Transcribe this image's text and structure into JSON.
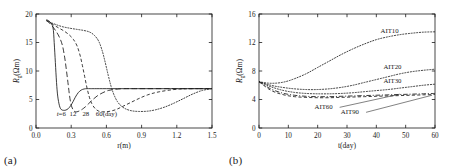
{
  "figure": {
    "panel_a_tag": "(a)",
    "panel_b_tag": "(b)"
  },
  "chart_data": [
    {
      "type": "line",
      "panel": "(a)",
      "title": "",
      "xlabel": "r(m)",
      "ylabel": "R_g(Ωm)",
      "ylabel_main": "R",
      "ylabel_sub": "g",
      "ylabel_unit": "(Ωm)",
      "xlim": [
        0.0,
        1.5
      ],
      "ylim": [
        0,
        20
      ],
      "xticks": [
        "0.0",
        "0.3",
        "0.6",
        "0.9",
        "1.2",
        "1.5"
      ],
      "xtick_values": [
        0.0,
        0.3,
        0.6,
        0.9,
        1.2,
        1.5
      ],
      "yticks": [
        "0",
        "5",
        "10",
        "15",
        "20"
      ],
      "ytick_values": [
        0,
        5,
        10,
        15,
        20
      ],
      "grid": false,
      "legend_position": "inline-annotations",
      "annotations": [
        {
          "text": "t=6",
          "x": 0.215,
          "y": 2.15
        },
        {
          "text": "12",
          "x": 0.315,
          "y": 2.15
        },
        {
          "text": "28",
          "x": 0.425,
          "y": 2.15
        },
        {
          "text": "60(day)",
          "x": 0.6,
          "y": 2.15
        }
      ],
      "series": [
        {
          "name": "t=6",
          "style": "solid",
          "x": [
            0.09,
            0.12,
            0.145,
            0.155,
            0.165,
            0.175,
            0.185,
            0.2,
            0.215,
            0.235,
            0.255,
            0.275,
            0.295,
            0.315,
            0.335,
            0.36,
            0.385,
            0.41,
            0.435,
            0.46,
            0.5,
            0.6,
            0.8,
            1.0,
            1.2,
            1.5
          ],
          "y": [
            19.0,
            18.6,
            17.6,
            15.0,
            11.5,
            8.0,
            5.6,
            3.9,
            3.25,
            3.1,
            3.15,
            3.4,
            3.9,
            4.6,
            5.4,
            6.2,
            6.65,
            6.85,
            6.9,
            6.9,
            6.9,
            6.9,
            6.9,
            6.9,
            6.9,
            6.9
          ]
        },
        {
          "name": "12",
          "style": "longdash",
          "x": [
            0.09,
            0.13,
            0.17,
            0.2,
            0.225,
            0.245,
            0.26,
            0.275,
            0.285,
            0.295,
            0.305,
            0.32,
            0.335,
            0.35,
            0.37,
            0.395,
            0.42,
            0.45,
            0.48,
            0.52,
            0.57,
            0.62,
            0.68,
            0.75,
            0.85,
            1.0,
            1.2,
            1.5
          ],
          "y": [
            18.9,
            18.1,
            17.0,
            15.9,
            14.5,
            12.3,
            10.0,
            7.5,
            5.8,
            4.5,
            3.7,
            3.05,
            2.85,
            2.85,
            3.0,
            3.3,
            3.7,
            4.3,
            4.9,
            5.6,
            6.2,
            6.6,
            6.8,
            6.9,
            6.9,
            6.9,
            6.9,
            6.9
          ]
        },
        {
          "name": "28",
          "style": "dash",
          "x": [
            0.09,
            0.14,
            0.19,
            0.24,
            0.285,
            0.32,
            0.35,
            0.375,
            0.395,
            0.415,
            0.435,
            0.455,
            0.475,
            0.5,
            0.53,
            0.565,
            0.6,
            0.645,
            0.69,
            0.74,
            0.8,
            0.87,
            0.95,
            1.05,
            1.2,
            1.35,
            1.5
          ],
          "y": [
            18.85,
            18.2,
            17.6,
            17.0,
            16.3,
            15.5,
            14.4,
            12.8,
            11.0,
            9.0,
            7.0,
            5.4,
            4.3,
            3.5,
            3.0,
            2.85,
            2.85,
            3.0,
            3.3,
            3.8,
            4.4,
            5.1,
            5.8,
            6.35,
            6.8,
            6.9,
            6.9
          ]
        },
        {
          "name": "60(day)",
          "style": "dot",
          "x": [
            0.09,
            0.15,
            0.22,
            0.29,
            0.35,
            0.41,
            0.46,
            0.5,
            0.535,
            0.565,
            0.59,
            0.615,
            0.64,
            0.665,
            0.695,
            0.73,
            0.77,
            0.82,
            0.88,
            0.95,
            1.02,
            1.1,
            1.18,
            1.26,
            1.34,
            1.42,
            1.5
          ],
          "y": [
            18.8,
            18.3,
            17.8,
            17.5,
            17.3,
            17.1,
            16.8,
            16.2,
            15.2,
            13.5,
            11.5,
            9.3,
            7.3,
            5.8,
            4.6,
            3.8,
            3.3,
            3.0,
            2.9,
            2.95,
            3.2,
            3.7,
            4.4,
            5.2,
            6.0,
            6.6,
            6.9
          ]
        }
      ]
    },
    {
      "type": "line",
      "panel": "(b)",
      "title": "",
      "xlabel": "t(day)",
      "ylabel": "R_g(Ωm)",
      "ylabel_main": "R",
      "ylabel_sub": "g",
      "ylabel_unit": "(Ωm)",
      "xlim": [
        0,
        60
      ],
      "ylim": [
        0,
        16
      ],
      "xticks": [
        "0",
        "10",
        "20",
        "30",
        "40",
        "50",
        "60"
      ],
      "xtick_values": [
        0,
        10,
        20,
        30,
        40,
        50,
        60
      ],
      "yticks": [
        "0",
        "4",
        "8",
        "12",
        "16"
      ],
      "ytick_values": [
        0,
        4,
        8,
        12,
        16
      ],
      "grid": false,
      "legend_position": "inline-annotations",
      "annotations": [
        {
          "text": "AIT10",
          "x": 44.5,
          "y": 13.3
        },
        {
          "text": "AIT20",
          "x": 45.5,
          "y": 8.3
        },
        {
          "text": "AIT30",
          "x": 45.5,
          "y": 6.3
        },
        {
          "text": "AIT60",
          "x": 22.0,
          "y": 2.6
        },
        {
          "text": "AIT90",
          "x": 31.0,
          "y": 1.9
        }
      ],
      "series": [
        {
          "name": "AIT10",
          "style": "dot",
          "x": [
            0,
            3,
            6,
            9,
            12,
            16,
            20,
            24,
            28,
            32,
            36,
            40,
            44,
            48,
            52,
            56,
            60
          ],
          "y": [
            6.5,
            6.3,
            6.3,
            6.5,
            6.9,
            7.6,
            8.5,
            9.4,
            10.3,
            11.1,
            11.8,
            12.4,
            12.8,
            13.1,
            13.3,
            13.45,
            13.5
          ]
        },
        {
          "name": "AIT20",
          "style": "dot",
          "x": [
            0,
            4,
            8,
            12,
            16,
            20,
            24,
            28,
            32,
            36,
            40,
            44,
            48,
            52,
            56,
            60
          ],
          "y": [
            6.5,
            6.0,
            5.7,
            5.5,
            5.4,
            5.4,
            5.5,
            5.7,
            6.0,
            6.4,
            6.8,
            7.2,
            7.6,
            7.9,
            8.1,
            8.25
          ]
        },
        {
          "name": "AIT30",
          "style": "dot",
          "x": [
            0,
            4,
            8,
            12,
            16,
            20,
            24,
            28,
            32,
            36,
            40,
            44,
            48,
            52,
            56,
            60
          ],
          "y": [
            6.5,
            5.8,
            5.3,
            5.0,
            4.85,
            4.8,
            4.8,
            4.85,
            4.95,
            5.1,
            5.25,
            5.4,
            5.6,
            5.8,
            6.0,
            6.15
          ]
        },
        {
          "name": "AIT60",
          "style": "dashdot",
          "x": [
            0,
            4,
            8,
            12,
            16,
            20,
            24,
            28,
            32,
            36,
            40,
            44,
            48,
            52,
            56,
            60
          ],
          "y": [
            6.5,
            5.5,
            4.9,
            4.6,
            4.45,
            4.4,
            4.4,
            4.45,
            4.5,
            4.55,
            4.6,
            4.65,
            4.7,
            4.75,
            4.8,
            4.85
          ]
        },
        {
          "name": "AIT90",
          "style": "dash",
          "x": [
            0,
            4,
            8,
            12,
            16,
            20,
            24,
            28,
            32,
            36,
            40,
            44,
            48,
            52,
            56,
            60
          ],
          "y": [
            6.5,
            5.3,
            4.7,
            4.4,
            4.3,
            4.25,
            4.25,
            4.3,
            4.35,
            4.4,
            4.45,
            4.5,
            4.55,
            4.6,
            4.65,
            4.7
          ]
        }
      ]
    }
  ]
}
